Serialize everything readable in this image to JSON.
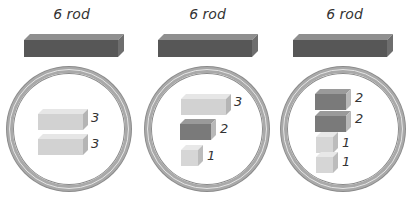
{
  "panels": [
    {
      "label": "6 rod",
      "rod_value": 6,
      "pieces": [
        {
          "value": 3,
          "label": "3",
          "color": "#d2d2d2"
        },
        {
          "value": 3,
          "label": "3",
          "color": "#d2d2d2"
        }
      ]
    },
    {
      "label": "6 rod",
      "rod_value": 6,
      "pieces": [
        {
          "value": 3,
          "label": "3",
          "color": "#d2d2d2"
        },
        {
          "value": 2,
          "label": "2",
          "color": "#7a7a7a"
        },
        {
          "value": 1,
          "label": "1",
          "color": "#d6d6d6"
        }
      ]
    },
    {
      "label": "6 rod",
      "rod_value": 6,
      "pieces": [
        {
          "value": 2,
          "label": "2",
          "color": "#7a7a7a"
        },
        {
          "value": 2,
          "label": "2",
          "color": "#7a7a7a"
        },
        {
          "value": 1,
          "label": "1",
          "color": "#d6d6d6"
        },
        {
          "value": 1,
          "label": "1",
          "color": "#d6d6d6"
        }
      ]
    }
  ],
  "colors": {
    "rod": "#575757",
    "ring": "#a9a9a9",
    "light_block": "#d2d2d2",
    "dark_block": "#7a7a7a"
  }
}
